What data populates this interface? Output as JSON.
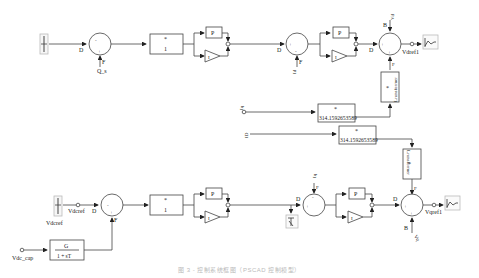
{
  "diagram": {
    "type": "control-block-diagram",
    "top_loop": {
      "source_label": "",
      "sum1": {
        "in_label": "D",
        "fb_label": "F",
        "fb_signal": "Q_s",
        "in_sign": "-",
        "fb_sign": "+"
      },
      "gain1": {
        "top": "*",
        "bottom": "1"
      },
      "pi1": {
        "p_label": "P",
        "i_label": "I"
      },
      "sum2": {
        "in_label": "D",
        "fb_label": "F",
        "fb_signal": "Id",
        "in_sign": "+",
        "fb_sign": "-"
      },
      "pi2": {
        "p_label": "P",
        "i_label": "I"
      },
      "sum3": {
        "in_label": "D",
        "top_label": "B",
        "top_signal": "Vd",
        "bottom_label": "F",
        "out_label": "Vdref1",
        "sign_left": "+",
        "sign_bottom": "+"
      },
      "transformer_block": {
        "label": "Lransformer",
        "value": "*"
      },
      "scope_icon": "graph-icon"
    },
    "middle": {
      "mult1": {
        "input_signal": "Iq",
        "top": "*",
        "bottom": "314.15926535​89"
      },
      "mult2": {
        "input_signal": "ID",
        "top": "*",
        "bottom": "314.1592653589"
      }
    },
    "bottom_loop": {
      "source_label": "Vdcref",
      "source_node_label": "Vdcref",
      "sum1": {
        "in_label": "D",
        "fb_label": "F",
        "in_sign": "-",
        "fb_sign": "+"
      },
      "filter": {
        "numerator": "G",
        "denominator": "1 + sT",
        "input_signal": "Vdc_cap"
      },
      "gain1": {
        "top": "*",
        "bottom": "1"
      },
      "pi1": {
        "p_label": "P",
        "i_label": "I"
      },
      "limiter_icon": "limiter-icon",
      "limiter_out_label": "D",
      "sum2": {
        "in_label": "D",
        "fb_label": "F",
        "fb_signal": "Iq",
        "in_sign": "+",
        "fb_sign": "-"
      },
      "pi2": {
        "p_label": "P",
        "i_label": "I"
      },
      "sum3": {
        "in_label": "D",
        "top_label": "F",
        "bottom_label": "B",
        "bottom_signal": "Vq",
        "out_label": "Vqref1",
        "sign_left": "+",
        "sign_bottom": "+"
      },
      "transformer_block": {
        "label": "Lransformer",
        "value": "*"
      },
      "scope_icon": "graph-icon"
    },
    "caption": "图 3 - 控制系统框图（PSCAD 控制模型）"
  }
}
